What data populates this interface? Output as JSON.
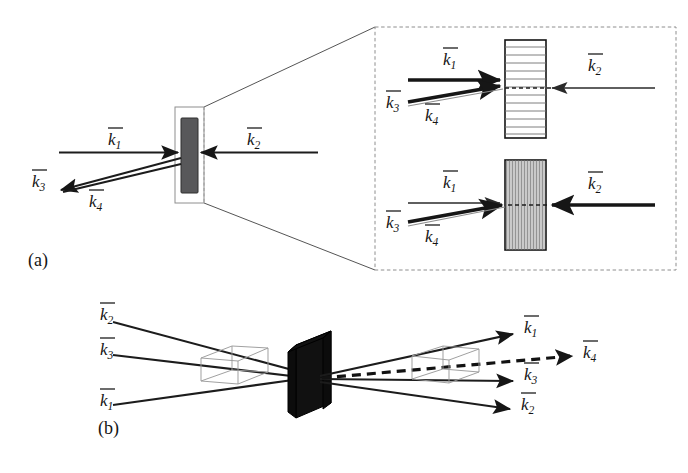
{
  "figure": {
    "background_color": "#ffffff",
    "width": 688,
    "height": 473
  },
  "panels": [
    {
      "id": "a",
      "label": "(a)",
      "description": "Side view of nonlinear slab with four interacting beams and magnified callout",
      "labels": [
        {
          "name": "k1",
          "symbol": "k",
          "subscript": "1",
          "overbar": true,
          "text": "k̄1"
        },
        {
          "name": "k2",
          "symbol": "k",
          "subscript": "2",
          "overbar": true,
          "text": "k̄2"
        },
        {
          "name": "k3",
          "symbol": "k",
          "subscript": "3",
          "overbar": true,
          "text": "k̄3"
        },
        {
          "name": "k4",
          "symbol": "k",
          "subscript": "4",
          "overbar": true,
          "text": "k̄4"
        }
      ]
    },
    {
      "id": "b",
      "label": "(b)",
      "description": "Three-dimensional perspective of the phase-matching geometry",
      "labels": [
        {
          "name": "k1",
          "symbol": "k",
          "subscript": "1",
          "overbar": true,
          "text": "k̄1"
        },
        {
          "name": "k2",
          "symbol": "k",
          "subscript": "2",
          "overbar": true,
          "text": "k̄2"
        },
        {
          "name": "k3",
          "symbol": "k",
          "subscript": "3",
          "overbar": true,
          "text": "k̄3"
        },
        {
          "name": "k4",
          "symbol": "k",
          "subscript": "4",
          "overbar": true,
          "text": "k̄4"
        }
      ]
    }
  ],
  "insets": [
    {
      "id": "top",
      "name": "transmission-grating-inset",
      "grating_orientation": "horizontal",
      "grating_line_count": 12,
      "labels": [
        {
          "name": "k1",
          "text": "k̄1"
        },
        {
          "name": "k2",
          "text": "k̄2"
        },
        {
          "name": "k3",
          "text": "k̄3"
        },
        {
          "name": "k4",
          "text": "k̄4"
        }
      ]
    },
    {
      "id": "bottom",
      "name": "reflection-grating-inset",
      "grating_orientation": "vertical",
      "grating_line_count": 34,
      "labels": [
        {
          "name": "k1",
          "text": "k̄1"
        },
        {
          "name": "k2",
          "text": "k̄2"
        },
        {
          "name": "k3",
          "text": "k̄3"
        },
        {
          "name": "k4",
          "text": "k̄4"
        }
      ]
    }
  ],
  "symbols": {
    "k1": "k",
    "k2": "k",
    "k3": "k",
    "k4": "k",
    "sub1": "1",
    "sub2": "2",
    "sub3": "3",
    "sub4": "4",
    "panel_a": "(a)",
    "panel_b": "(b)"
  },
  "colors": {
    "ink": "#161616",
    "slab_panel_a": "#58585a",
    "slab_panel_b": "#0c0c0c",
    "grating_line": "#6f6f6f",
    "callout": "#9a9a9a",
    "faint_beam": "#8d8d8d",
    "background": "#ffffff"
  }
}
